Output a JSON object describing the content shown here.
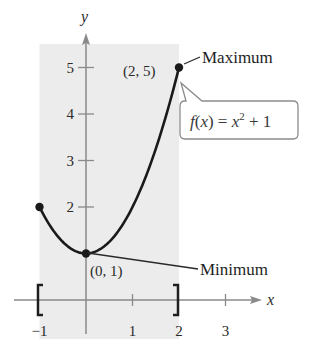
{
  "chart_data": {
    "type": "line",
    "title": "",
    "function": "f(x) = x^2 + 1",
    "xlabel": "x",
    "ylabel": "y",
    "xlim": [
      -1.5,
      3.8
    ],
    "ylim": [
      0,
      5.5
    ],
    "x_ticks": [
      -1,
      1,
      2,
      3
    ],
    "x_tick_labels": [
      "−1",
      "1",
      "2",
      "3"
    ],
    "y_ticks": [
      2,
      3,
      4,
      5
    ],
    "y_tick_labels": [
      "2",
      "3",
      "4",
      "5"
    ],
    "grid": false,
    "domain_interval": {
      "start": -1,
      "end": 2,
      "notation": "[ -1, 2 ]"
    },
    "shaded_region": {
      "x_start": -1,
      "x_end": 2,
      "color": "#ececec"
    },
    "series": [
      {
        "name": "f(x) = x^2 + 1",
        "x": [
          -1,
          -0.5,
          0,
          0.5,
          1,
          1.5,
          2
        ],
        "y": [
          2,
          1.25,
          1,
          1.25,
          2,
          3.25,
          5
        ],
        "color": "#1a1a1a"
      }
    ],
    "points": [
      {
        "x": -1,
        "y": 2,
        "label": ""
      },
      {
        "x": 0,
        "y": 1,
        "label": "(0, 1)"
      },
      {
        "x": 2,
        "y": 5,
        "label": "(2, 5)"
      }
    ],
    "annotations": [
      {
        "text": "Maximum",
        "target": [
          2,
          5
        ]
      },
      {
        "text": "Minimum",
        "target": [
          0,
          1
        ]
      },
      {
        "text": "f(x) = x² + 1",
        "type": "callout"
      }
    ]
  },
  "labels": {
    "y_axis": "y",
    "x_axis": "x",
    "max_point": "(2, 5)",
    "min_point": "(0, 1)",
    "maximum": "Maximum",
    "minimum": "Minimum",
    "formula_f": "f",
    "formula_rest_1": "(",
    "formula_x1": "x",
    "formula_rest_2": ") = ",
    "formula_x2": "x",
    "formula_exp": "2",
    "formula_rest_3": " + 1",
    "bracket_left": "[",
    "bracket_right": "]"
  },
  "colors": {
    "axis": "#8a8a8a",
    "curve": "#1a1a1a",
    "shade": "#ececec",
    "text": "#2a2a2a",
    "callout_border": "#8c8c8c"
  }
}
